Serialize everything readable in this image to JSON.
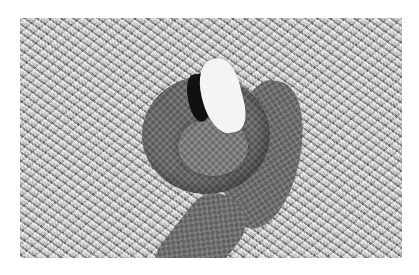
{
  "image": {
    "subject": "cottonmouth snake coiled on grass with mouth open",
    "style": "black-and-white photograph",
    "alt": "Coiled cottonmouth snake gaping its white mouth in grass"
  },
  "caption": {
    "text": ""
  }
}
